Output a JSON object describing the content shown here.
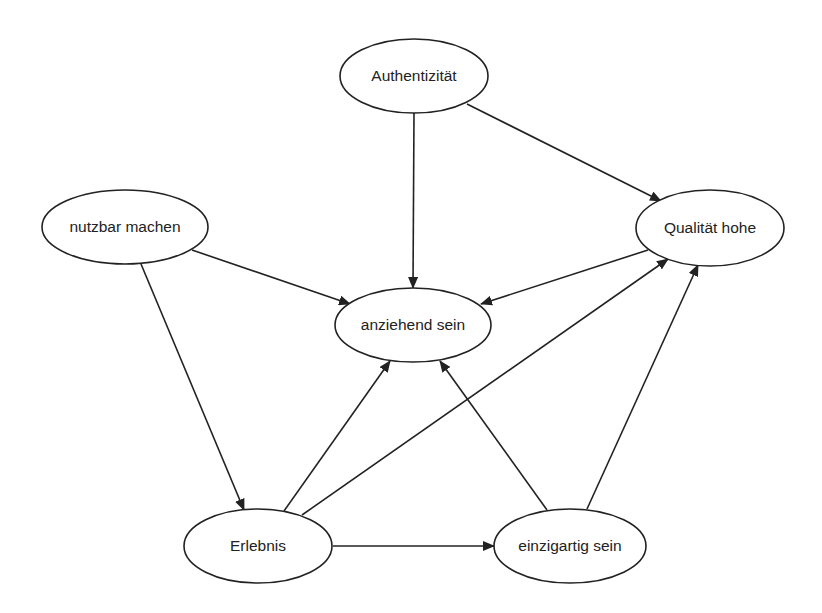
{
  "diagram": {
    "type": "directed-graph",
    "colors": {
      "stroke": "#222222",
      "background": "#ffffff",
      "node_fill": "#ffffff"
    },
    "nodes": [
      {
        "id": "authentizitaet",
        "label": "Authentizität",
        "cx": 414,
        "cy": 76,
        "rx": 74,
        "ry": 37
      },
      {
        "id": "nutzbar",
        "label": "nutzbar machen",
        "cx": 125,
        "cy": 227,
        "rx": 83,
        "ry": 37
      },
      {
        "id": "qualitaet",
        "label": "Qualität hohe",
        "cx": 710,
        "cy": 228,
        "rx": 74,
        "ry": 38
      },
      {
        "id": "anziehend",
        "label": "anziehend sein",
        "cx": 413,
        "cy": 325,
        "rx": 78,
        "ry": 37
      },
      {
        "id": "erlebnis",
        "label": "Erlebnis",
        "cx": 258,
        "cy": 546,
        "rx": 74,
        "ry": 37
      },
      {
        "id": "einzigartig",
        "label": "einzigartig sein",
        "cx": 570,
        "cy": 546,
        "rx": 76,
        "ry": 37
      }
    ],
    "edges": [
      {
        "from": "authentizitaet",
        "to": "anziehend",
        "x1": 414,
        "y1": 113,
        "x2": 413,
        "y2": 288
      },
      {
        "from": "authentizitaet",
        "to": "qualitaet",
        "x1": 467,
        "y1": 104,
        "x2": 661,
        "y2": 201
      },
      {
        "from": "nutzbar",
        "to": "anziehend",
        "x1": 192,
        "y1": 250,
        "x2": 350,
        "y2": 304
      },
      {
        "from": "nutzbar",
        "to": "erlebnis",
        "x1": 141,
        "y1": 264,
        "x2": 244,
        "y2": 510
      },
      {
        "from": "qualitaet",
        "to": "anziehend",
        "x1": 648,
        "y1": 250,
        "x2": 481,
        "y2": 304
      },
      {
        "from": "erlebnis",
        "to": "anziehend",
        "x1": 284,
        "y1": 511,
        "x2": 390,
        "y2": 361
      },
      {
        "from": "erlebnis",
        "to": "qualitaet",
        "x1": 302,
        "y1": 515,
        "x2": 668,
        "y2": 259
      },
      {
        "from": "erlebnis",
        "to": "einzigartig",
        "x1": 333,
        "y1": 546,
        "x2": 494,
        "y2": 546
      },
      {
        "from": "einzigartig",
        "to": "anziehend",
        "x1": 547,
        "y1": 510,
        "x2": 440,
        "y2": 361
      },
      {
        "from": "einzigartig",
        "to": "qualitaet",
        "x1": 587,
        "y1": 509,
        "x2": 698,
        "y2": 265
      }
    ]
  }
}
